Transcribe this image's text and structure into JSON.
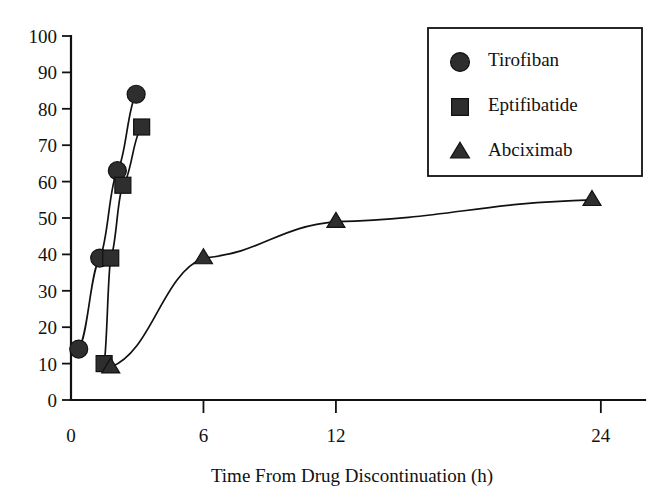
{
  "chart_data": {
    "type": "line",
    "title": "",
    "xlabel": "Time From Drug Discontinuation (h)",
    "ylabel": "",
    "xlim": [
      0,
      26
    ],
    "ylim": [
      0,
      100
    ],
    "grid": false,
    "legend_position": "top-right",
    "x_ticks": [
      {
        "value": 0,
        "label": "0"
      },
      {
        "value": 6,
        "label": "6"
      },
      {
        "value": 12,
        "label": "12"
      },
      {
        "value": 24,
        "label": "24"
      }
    ],
    "y_ticks": [
      {
        "value": 0,
        "label": "0"
      },
      {
        "value": 10,
        "label": "10"
      },
      {
        "value": 20,
        "label": "20"
      },
      {
        "value": 30,
        "label": "30"
      },
      {
        "value": 40,
        "label": "40"
      },
      {
        "value": 50,
        "label": "50"
      },
      {
        "value": 60,
        "label": "60"
      },
      {
        "value": 70,
        "label": "70"
      },
      {
        "value": 80,
        "label": "80"
      },
      {
        "value": 90,
        "label": "90"
      },
      {
        "value": 100,
        "label": "100"
      }
    ],
    "series": [
      {
        "name": "Tirofiban",
        "marker": "circle",
        "color": "#2e2e2e",
        "points": [
          {
            "x": 0.35,
            "y": 14
          },
          {
            "x": 1.3,
            "y": 39
          },
          {
            "x": 2.1,
            "y": 63
          },
          {
            "x": 2.95,
            "y": 84
          }
        ]
      },
      {
        "name": "Eptifibatide",
        "marker": "square",
        "color": "#2e2e2e",
        "points": [
          {
            "x": 1.5,
            "y": 10
          },
          {
            "x": 1.8,
            "y": 39
          },
          {
            "x": 2.35,
            "y": 59
          },
          {
            "x": 3.2,
            "y": 75
          }
        ]
      },
      {
        "name": "Abciximab",
        "marker": "triangle",
        "color": "#2e2e2e",
        "points": [
          {
            "x": 1.8,
            "y": 9
          },
          {
            "x": 6.0,
            "y": 39
          },
          {
            "x": 12.0,
            "y": 49
          },
          {
            "x": 23.6,
            "y": 55
          }
        ]
      }
    ],
    "legend": [
      {
        "label": "Tirofiban",
        "marker": "circle"
      },
      {
        "label": "Eptifibatide",
        "marker": "square"
      },
      {
        "label": "Abciximab",
        "marker": "triangle"
      }
    ]
  }
}
